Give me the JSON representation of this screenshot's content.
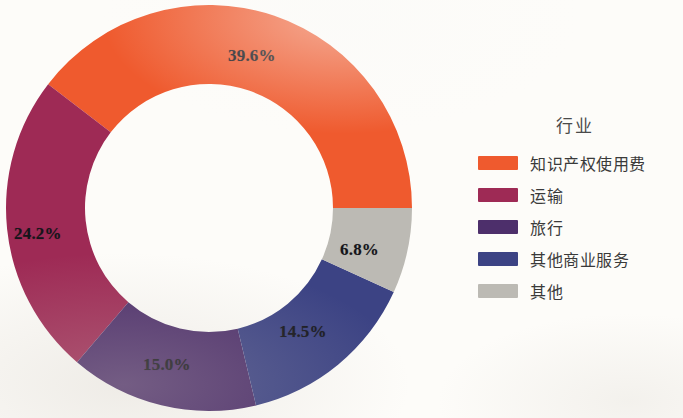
{
  "chart_data": {
    "type": "pie",
    "variant": "donut",
    "title": "",
    "legend_title": "行业",
    "legend_position": "right",
    "grid": false,
    "units": "percent",
    "categories": [
      "知识产权使用费",
      "运输",
      "旅行",
      "其他商业服务",
      "其他"
    ],
    "values": [
      39.6,
      24.2,
      15.0,
      14.5,
      6.8
    ],
    "labels": [
      "39.6%",
      "24.2%",
      "15.0%",
      "14.5%",
      "6.8%"
    ],
    "colors": [
      "#ef5a2e",
      "#9e2a55",
      "#4d2f6b",
      "#3c4384",
      "#bcbab4"
    ],
    "series": [
      {
        "name": "行业",
        "values": [
          39.6,
          24.2,
          15.0,
          14.5,
          6.8
        ]
      }
    ],
    "start_angle_deg": 0,
    "direction": "counterclockwise",
    "inner_radius_ratio": 0.61
  },
  "chart": {
    "center_x": 209,
    "center_y": 208,
    "outer_radius": 203,
    "inner_radius": 124,
    "slices": [
      {
        "key": "ip-royalties",
        "category": "知识产权使用费",
        "value": 39.6,
        "label": "39.6%",
        "color": "#ef5a2e",
        "label_x": 228,
        "label_y": 46
      },
      {
        "key": "transport",
        "category": "运输",
        "value": 24.2,
        "label": "24.2%",
        "color": "#9e2a55",
        "label_x": 14,
        "label_y": 224
      },
      {
        "key": "travel",
        "category": "旅行",
        "value": 15.0,
        "label": "15.0%",
        "color": "#4d2f6b",
        "label_x": 143,
        "label_y": 355
      },
      {
        "key": "other-business-services",
        "category": "其他商业服务",
        "value": 14.5,
        "label": "14.5%",
        "color": "#3c4384",
        "label_x": 279,
        "label_y": 322
      },
      {
        "key": "other",
        "category": "其他",
        "value": 6.8,
        "label": "6.8%",
        "color": "#bcbab4",
        "label_x": 340,
        "label_y": 240
      }
    ]
  },
  "legend": {
    "title": "行业",
    "items": [
      {
        "key": "ip-royalties",
        "label": "知识产权使用费",
        "color": "#ef5a2e"
      },
      {
        "key": "transport",
        "label": "运输",
        "color": "#9e2a55"
      },
      {
        "key": "travel",
        "label": "旅行",
        "color": "#4d2f6b"
      },
      {
        "key": "other-business-services",
        "label": "其他商业服务",
        "color": "#3c4384"
      },
      {
        "key": "other",
        "label": "其他",
        "color": "#bcbab4"
      }
    ]
  }
}
